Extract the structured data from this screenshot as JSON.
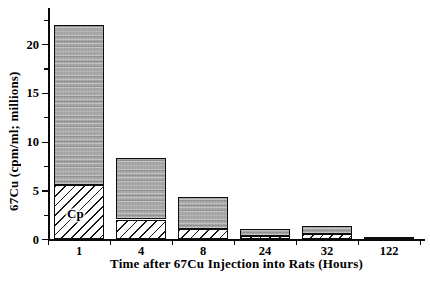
{
  "chart_data": {
    "type": "bar",
    "stacked": true,
    "title": "",
    "xlabel": "Time after 67Cu Injection into Rats (Hours)",
    "ylabel": "67Cu (cpm/ml; millions)",
    "categories": [
      "1",
      "4",
      "8",
      "24",
      "32",
      "122"
    ],
    "series": [
      {
        "name": "Cp",
        "style": "hatched",
        "values": [
          5.5,
          2.0,
          1.0,
          0.3,
          0.5,
          0.1
        ]
      },
      {
        "name": "",
        "style": "stippled",
        "values": [
          16.5,
          6.3,
          3.3,
          0.7,
          0.8,
          0.1
        ]
      }
    ],
    "totals": [
      22.0,
      8.3,
      4.3,
      1.0,
      1.3,
      0.2
    ],
    "ylim": [
      0,
      23.7
    ],
    "y_major_ticks": [
      0,
      5,
      10,
      15,
      20
    ],
    "y_minor_tick_interval": 2.5,
    "grid": false,
    "legend": "none",
    "annotations": [
      {
        "text": "Cp",
        "category_index": 0,
        "y_value": 2.6
      }
    ],
    "colors": {
      "background": "#ffffff",
      "axis": "#0a0a0a",
      "text": "#000000",
      "stipple_fill": "#a9a9a9",
      "hatch_lines": "#161616",
      "hatch_background": "#ffffff"
    }
  }
}
